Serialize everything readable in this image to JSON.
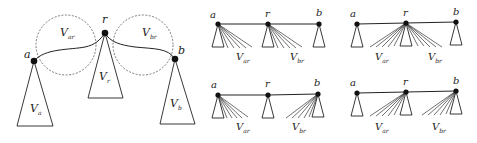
{
  "diagram": {
    "main": {
      "nodes": [
        {
          "id": "a",
          "label": "a",
          "x": 34,
          "y": 61
        },
        {
          "id": "r",
          "label": "r",
          "x": 105,
          "y": 33
        },
        {
          "id": "b",
          "label": "b",
          "x": 175,
          "y": 59
        }
      ],
      "subtrees": [
        {
          "id": "Va",
          "label_main": "V",
          "label_sub": "a"
        },
        {
          "id": "Vr",
          "label_main": "V",
          "label_sub": "r"
        },
        {
          "id": "Vb",
          "label_main": "V",
          "label_sub": "b"
        }
      ],
      "regions": [
        {
          "id": "Var",
          "label_main": "V",
          "label_sub": "ar"
        },
        {
          "id": "Vbr",
          "label_main": "V",
          "label_sub": "br"
        }
      ]
    },
    "panels": [
      {
        "id": "top-middle",
        "nodes": {
          "a": "a",
          "r": "r",
          "b": "b"
        },
        "fan_label_left": {
          "main": "V",
          "sub": "ar"
        },
        "fan_label_right": {
          "main": "V",
          "sub": "br"
        },
        "description": "V_ar fans from a, V_br fans from r"
      },
      {
        "id": "top-right",
        "nodes": {
          "a": "a",
          "r": "r",
          "b": "b"
        },
        "fan_label_left": {
          "main": "V",
          "sub": "ar"
        },
        "fan_label_right": {
          "main": "V",
          "sub": "br"
        },
        "description": "V_ar and V_br both fan from r"
      },
      {
        "id": "bottom-middle",
        "nodes": {
          "a": "a",
          "r": "r",
          "b": "b"
        },
        "fan_label_left": {
          "main": "V",
          "sub": "ar"
        },
        "fan_label_right": {
          "main": "V",
          "sub": "br"
        },
        "description": "V_ar fans from a, V_br fans from b"
      },
      {
        "id": "bottom-right",
        "nodes": {
          "a": "a",
          "r": "r",
          "b": "b"
        },
        "fan_label_left": {
          "main": "V",
          "sub": "ar"
        },
        "fan_label_right": {
          "main": "V",
          "sub": "br"
        },
        "description": "V_ar fans from r, V_br fans from b"
      }
    ]
  }
}
